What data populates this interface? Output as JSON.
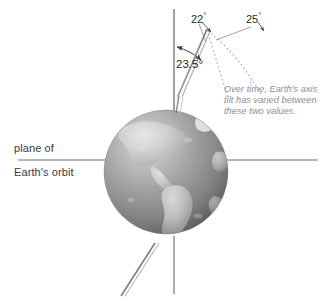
{
  "diagram": {
    "plane_label_line1": "plane of",
    "plane_label_line2": "Earth's orbit",
    "tilt_current": "23.5",
    "tilt_min": "22",
    "tilt_max": "25",
    "degree_symbol": "°",
    "caption_line1": "Over time, Earth's axis",
    "caption_line2": "tilt has varied between",
    "caption_line3": "these two values.",
    "colors": {
      "line": "#5a5a5a",
      "axis": "#6b6b6b",
      "dotted": "#a9a9a9",
      "text": "#2b2b2b",
      "caption_text": "#8e8e8e",
      "globe_ocean": "#8f8f8f",
      "globe_land": "#b9b9b9",
      "globe_shadow": "#6e6e6e",
      "background": "#ffffff"
    },
    "geometry": {
      "globe_center_x": 166,
      "globe_center_y": 172,
      "globe_radius": 62,
      "vertical_line_x": 174,
      "orbit_plane_y": 160,
      "axis_tilt_degrees": 23.5,
      "fan_apex_x": 207,
      "fan_apex_y": 28
    }
  }
}
